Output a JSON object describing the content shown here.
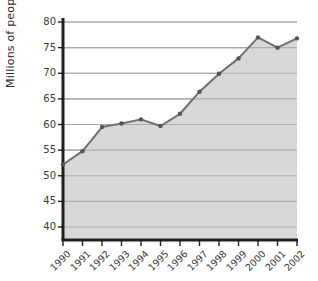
{
  "chart_data": {
    "type": "area",
    "title": "",
    "subtitle": "",
    "xlabel": "",
    "ylabel": "Millions of people",
    "categories": [
      "1990",
      "1991",
      "1992",
      "1993",
      "1994",
      "1995",
      "1996",
      "1997",
      "1998",
      "1999",
      "2000",
      "2001",
      "2002"
    ],
    "values": [
      52.2,
      54.8,
      59.5,
      60.2,
      61.0,
      59.7,
      62.1,
      66.4,
      69.9,
      72.9,
      77.0,
      75.0,
      76.8
    ],
    "series": [
      {
        "name": "Millions of people",
        "values": [
          52.2,
          54.8,
          59.5,
          60.2,
          61.0,
          59.7,
          62.1,
          66.4,
          69.9,
          72.9,
          77.0,
          75.0,
          76.8
        ]
      }
    ],
    "ylim": [
      40,
      80
    ],
    "yticks": [
      40,
      45,
      50,
      55,
      60,
      65,
      70,
      75,
      80
    ],
    "ytick_labels": [
      "40",
      "45",
      "50",
      "55",
      "60",
      "65",
      "70",
      "75",
      "80"
    ],
    "xtick_labels": [
      "1990",
      "1991",
      "1992",
      "1993",
      "1994",
      "1995",
      "1996",
      "1997",
      "1998",
      "1999",
      "2000",
      "2001",
      "2002"
    ],
    "grid": "horizontal",
    "legend": "none",
    "annotations": [],
    "colors": {
      "area_fill": "#d5d5d5",
      "line": "#6f6f6f",
      "marker": "#555555",
      "gridline": "#a8a8a8",
      "axis": "#1f1f1f",
      "tick_text": "#3a3a3a",
      "background": "#ffffff"
    }
  },
  "axes": {
    "y_title": "Millions of people"
  }
}
